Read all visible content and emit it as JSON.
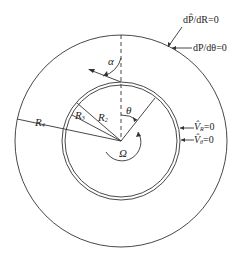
{
  "diagram": {
    "type": "concentric-annulus-schematic",
    "colors": {
      "stroke": "#333333",
      "background": "#ffffff"
    },
    "geometry": {
      "center": [
        121,
        141
      ],
      "outer_radius": 106,
      "inner_radius_outer_ring": 59,
      "inner_radius_inner_ring": 56
    },
    "labels": {
      "R4": "R",
      "R4_sub": "4",
      "R3": "R",
      "R3_sub": "3",
      "R2": "R",
      "R2_sub": "2",
      "alpha": "α",
      "theta": "θ",
      "omega": "Ω",
      "bc_outer_1": "dP̂/dR=0",
      "bc_outer_2": "dP/dθ=0",
      "bc_inner_1_sym": "V̂",
      "bc_inner_1_sub": "R",
      "bc_inner_1_eq": "=0",
      "bc_inner_2_sym": "V̂",
      "bc_inner_2_sub": "θ",
      "bc_inner_2_eq": "=0"
    }
  }
}
